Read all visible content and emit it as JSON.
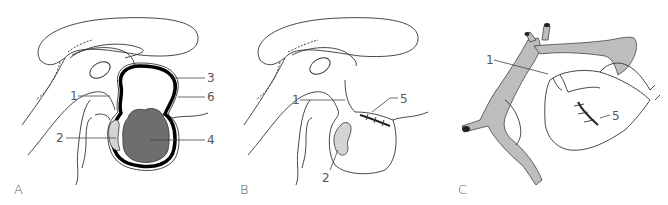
{
  "figure": {
    "panels": [
      {
        "letter": "A",
        "labels": {
          "l1": "1",
          "l2": "2",
          "l3": "3",
          "l4": "4",
          "l6": "6"
        }
      },
      {
        "letter": "B",
        "labels": {
          "l1": "1",
          "l2": "2",
          "l5": "5"
        }
      },
      {
        "letter": "C",
        "labels": {
          "l1": "1",
          "l5": "5"
        }
      }
    ],
    "colors": {
      "outline": "#333333",
      "tumor_fill": "#6e6e6e",
      "capsule": "#000000",
      "gland_fill": "#d4d4d4",
      "vessel_fill": "#bdbdbd"
    }
  }
}
